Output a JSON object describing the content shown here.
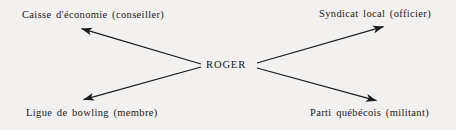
{
  "diagram": {
    "type": "radial-ego-network",
    "background_color": "#f2f1ef",
    "line_color": "#1b1b1b",
    "text_color": "#1a1a1a",
    "center": {
      "label": "ROGER",
      "x": 228,
      "y": 66
    },
    "nodes": [
      {
        "id": "top-left",
        "label": "Caisse d'économie (conseiller)",
        "organization": "Caisse d'économie",
        "role": "conseiller",
        "x": 80,
        "y": 16
      },
      {
        "id": "top-right",
        "label": "Syndicat local (officier)",
        "organization": "Syndicat local",
        "role": "officier",
        "x": 385,
        "y": 15
      },
      {
        "id": "bottom-left",
        "label": "Ligue de bowling (membre)",
        "organization": "Ligue de bowling",
        "role": "membre",
        "x": 82,
        "y": 113
      },
      {
        "id": "bottom-right",
        "label": "Parti québécois (militant)",
        "organization": "Parti québécois",
        "role": "militant",
        "x": 378,
        "y": 113
      }
    ],
    "arrows": [
      {
        "id": "arrow-to-caisse",
        "from": "center",
        "to": "top-left",
        "from_x": 201,
        "from_y": 64,
        "to_x": 80,
        "to_y": 28,
        "arrowhead": "end"
      },
      {
        "id": "arrow-to-syndicat",
        "from": "center",
        "to": "top-right",
        "from_x": 257,
        "from_y": 63,
        "to_x": 385,
        "to_y": 26,
        "arrowhead": "end"
      },
      {
        "id": "arrow-to-ligue",
        "from": "center",
        "to": "bottom-left",
        "from_x": 201,
        "from_y": 67,
        "to_x": 82,
        "to_y": 100,
        "arrowhead": "end"
      },
      {
        "id": "arrow-to-parti",
        "from": "center",
        "to": "bottom-right",
        "from_x": 257,
        "from_y": 68,
        "to_x": 378,
        "to_y": 101,
        "arrowhead": "end"
      }
    ]
  }
}
